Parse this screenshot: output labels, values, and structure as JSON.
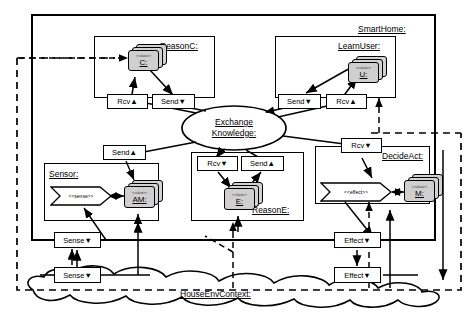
{
  "diagram": {
    "title": "SmartHome:",
    "outer_container": {
      "label": "SmartHome:"
    },
    "context": {
      "label": "HouseEnvContext:"
    },
    "hub": {
      "line1": "Exchange",
      "line2": "Knowledge:"
    },
    "components": [
      {
        "id": "reasonc",
        "label": "ReasonC:",
        "class": {
          "stereotype": "<<class>>",
          "name": "C:"
        },
        "ports": [
          {
            "name": "Rcv",
            "direction": "up",
            "glyph": "▲",
            "label": "Rcv▲"
          },
          {
            "name": "Send",
            "direction": "down",
            "glyph": "▼",
            "label": "Send▼"
          }
        ]
      },
      {
        "id": "learnuser",
        "label": "LearnUser:",
        "class": {
          "stereotype": "<<class>>",
          "name": "U:"
        },
        "ports": [
          {
            "name": "Send",
            "direction": "down",
            "glyph": "▼",
            "label": "Send▼"
          },
          {
            "name": "Rcv",
            "direction": "up",
            "glyph": "▲",
            "label": "Rcv▲"
          }
        ]
      },
      {
        "id": "sensor",
        "label": "Sensor:",
        "class": {
          "stereotype": "<<class>>",
          "name": "AM:"
        },
        "interface": {
          "stereotype": "<<sense>>"
        },
        "ports": [
          {
            "name": "Send",
            "direction": "up",
            "glyph": "▲",
            "label": "Send▲"
          }
        ]
      },
      {
        "id": "reasone",
        "label": "ReasonE:",
        "class": {
          "stereotype": "<<class>>",
          "name": "E:"
        },
        "ports": [
          {
            "name": "Rcv",
            "direction": "down",
            "glyph": "▼",
            "label": "Rcv▼"
          },
          {
            "name": "Send",
            "direction": "up",
            "glyph": "▲",
            "label": "Send▲"
          }
        ]
      },
      {
        "id": "decideact",
        "label": "DecideAct:",
        "class": {
          "stereotype": "<<class>>",
          "name": "M:"
        },
        "interface": {
          "stereotype": "<<effect>>"
        },
        "ports": [
          {
            "name": "Rcv",
            "direction": "down",
            "glyph": "▼",
            "label": "Rcv▼"
          }
        ]
      }
    ],
    "boundary_ports": [
      {
        "id": "sense-inner",
        "label": "Sense▼",
        "name": "Sense",
        "glyph": "▼"
      },
      {
        "id": "sense-outer",
        "label": "Sense▼",
        "name": "Sense",
        "glyph": "▼"
      },
      {
        "id": "effect-inner",
        "label": "Effect▼",
        "name": "Effect",
        "glyph": "▼"
      },
      {
        "id": "effect-outer",
        "label": "Effect▼",
        "name": "Effect",
        "glyph": "▼"
      }
    ]
  }
}
